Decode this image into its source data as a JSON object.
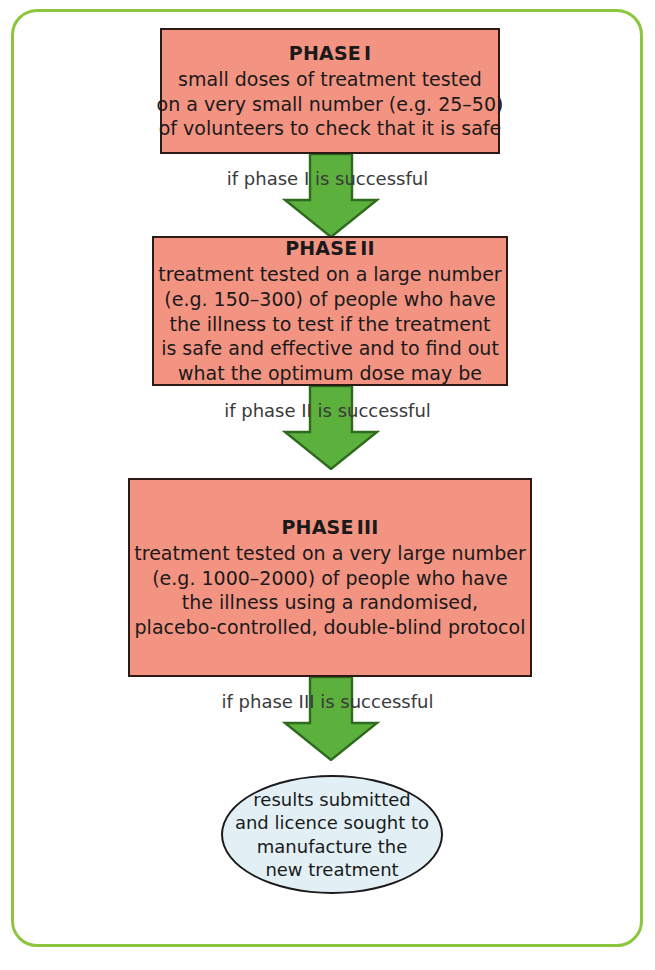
{
  "diagram": {
    "colors": {
      "frame_border": "#8CC63F",
      "phase_fill": "#F39382",
      "phase_border": "#2E1A15",
      "arrow_fill": "#5CB03C",
      "arrow_border": "#2F6B1E",
      "outcome_fill": "#E2F0F6",
      "outcome_border": "#1B1B1B",
      "text": "#1A1A1A"
    },
    "phases": [
      {
        "title_word": "PHASE",
        "numeral": "I",
        "lines": [
          "small doses of treatment tested",
          "on a very small number (e.g. 25–50)",
          "of volunteers to check that it is safe"
        ]
      },
      {
        "title_word": "PHASE",
        "numeral": "II",
        "lines": [
          "treatment tested on a large number",
          "(e.g. 150–300) of people who have",
          "the illness to test if the treatment",
          "is safe and effective and to find out",
          "what the optimum dose may be"
        ]
      },
      {
        "title_word": "PHASE",
        "numeral": "III",
        "lines": [
          "treatment tested on a very large number",
          "(e.g. 1000–2000) of people who have",
          "the illness using a randomised,",
          "placebo-controlled, double-blind protocol"
        ]
      }
    ],
    "connectors": [
      {
        "label": "if phase I is successful"
      },
      {
        "label": "if phase II is successful"
      },
      {
        "label": "if phase III is successful"
      }
    ],
    "outcome": {
      "lines": [
        "results submitted",
        "and licence sought to",
        "manufacture the",
        "new treatment"
      ]
    }
  }
}
